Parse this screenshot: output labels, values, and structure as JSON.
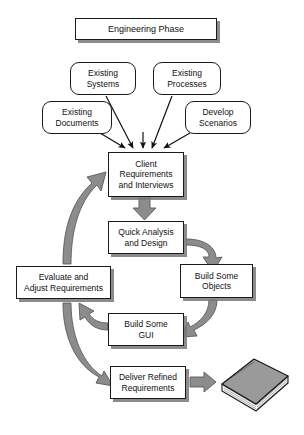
{
  "diagram": {
    "title": "Engineering Phase",
    "type": "flowchart",
    "orientation": "top-down-cycle",
    "palette": {
      "background": "#ffffff",
      "node_fill": "#ffffff",
      "node_stroke": "#1a1a1a",
      "text": "#111111",
      "shadow": "#787878",
      "arrow_fill": "#808080",
      "arrow_stroke": "#4d4d4d",
      "thin_arrow": "#1a1a1a",
      "book_cover": "#9a9a9a",
      "book_pages": "#f2f2f2"
    },
    "nodes": [
      {
        "id": "engineering-phase",
        "label": "Engineering Phase",
        "shape": "rect",
        "x": 75,
        "y": 18,
        "w": 142,
        "h": 22,
        "font": 9
      },
      {
        "id": "existing-systems",
        "label": "Existing\nSystems",
        "shape": "round",
        "x": 70,
        "y": 62,
        "w": 66,
        "h": 33,
        "font": 8.5
      },
      {
        "id": "existing-processes",
        "label": "Existing\nProcesses",
        "shape": "round",
        "x": 153,
        "y": 62,
        "w": 68,
        "h": 33,
        "font": 8.5
      },
      {
        "id": "existing-documents",
        "label": "Existing\nDocuments",
        "shape": "round",
        "x": 42,
        "y": 101,
        "w": 70,
        "h": 33,
        "font": 8.5
      },
      {
        "id": "develop-scenarios",
        "label": "Develop\nScenarios",
        "shape": "round",
        "x": 185,
        "y": 101,
        "w": 66,
        "h": 33,
        "font": 8.5
      },
      {
        "id": "client-requirements",
        "label": "Client\nRequirements\nand Interviews",
        "shape": "rect",
        "x": 108,
        "y": 152,
        "w": 76,
        "h": 45,
        "font": 8.5
      },
      {
        "id": "quick-analysis",
        "label": "Quick Analysis\nand Design",
        "shape": "rect",
        "x": 108,
        "y": 221,
        "w": 76,
        "h": 33,
        "font": 8.5
      },
      {
        "id": "evaluate-adjust",
        "label": "Evaluate and\nAdjust Requirements",
        "shape": "rect",
        "x": 16,
        "y": 266,
        "w": 95,
        "h": 33,
        "font": 8.5
      },
      {
        "id": "build-objects",
        "label": "Build Some\nObjects",
        "shape": "rect",
        "x": 180,
        "y": 264,
        "w": 73,
        "h": 34,
        "font": 8.5
      },
      {
        "id": "build-gui",
        "label": "Build Some\nGUI",
        "shape": "rect",
        "x": 108,
        "y": 313,
        "w": 76,
        "h": 33,
        "font": 8.5
      },
      {
        "id": "deliver-refined",
        "label": "Deliver Refined\nRequirements",
        "shape": "rect",
        "x": 110,
        "y": 366,
        "w": 76,
        "h": 33,
        "font": 8.5
      }
    ],
    "edges": [
      {
        "id": "existing-systems-to-client",
        "from": "existing-systems",
        "to": "client-requirements",
        "style": "thin-arrow"
      },
      {
        "id": "existing-processes-to-client",
        "from": "existing-processes",
        "to": "client-requirements",
        "style": "thin-arrow"
      },
      {
        "id": "existing-documents-to-client",
        "from": "existing-documents",
        "to": "client-requirements",
        "style": "thin-arrow"
      },
      {
        "id": "develop-scenarios-to-client",
        "from": "develop-scenarios",
        "to": "client-requirements",
        "style": "thin-arrow"
      },
      {
        "id": "client-to-quick-analysis",
        "from": "client-requirements",
        "to": "quick-analysis",
        "style": "block-arrow-down"
      },
      {
        "id": "quick-analysis-to-build-objects",
        "from": "quick-analysis",
        "to": "build-objects",
        "style": "curved-block-arrow"
      },
      {
        "id": "build-objects-to-build-gui",
        "from": "build-objects",
        "to": "build-gui",
        "style": "curved-block-arrow"
      },
      {
        "id": "build-gui-to-evaluate",
        "from": "build-gui",
        "to": "evaluate-adjust",
        "style": "curved-block-arrow"
      },
      {
        "id": "evaluate-to-client",
        "from": "evaluate-adjust",
        "to": "client-requirements",
        "style": "curved-block-arrow"
      },
      {
        "id": "evaluate-to-deliver",
        "from": "evaluate-adjust",
        "to": "deliver-refined",
        "style": "curved-block-arrow"
      },
      {
        "id": "deliver-to-document",
        "from": "deliver-refined",
        "to": "document-stack",
        "style": "block-arrow-right"
      }
    ],
    "icons": [
      {
        "id": "document-stack",
        "name": "book-stack-icon",
        "x": 218,
        "y": 358,
        "w": 74,
        "h": 56
      }
    ]
  }
}
